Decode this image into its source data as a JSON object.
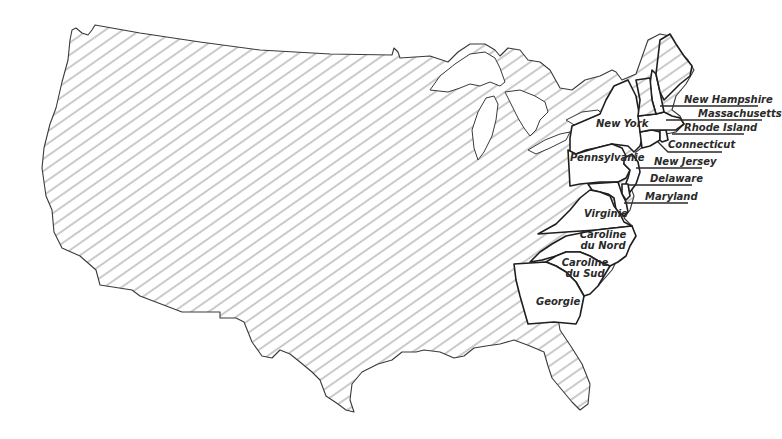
{
  "map": {
    "subject": "Thirteen original colonies on a map of the contiguous United States",
    "fill_pattern": "diagonal-hatch",
    "colors": {
      "outline": "#1e1e1e",
      "hatch": "#8a8a8a",
      "colony_fill": "#ffffff",
      "background": "#ffffff"
    },
    "colonies": [
      {
        "id": "new-hampshire",
        "label": "New Hampshire"
      },
      {
        "id": "massachusetts",
        "label": "Massachusetts"
      },
      {
        "id": "rhode-island",
        "label": "Rhode Island"
      },
      {
        "id": "connecticut",
        "label": "Connecticut"
      },
      {
        "id": "new-york",
        "label": "New York"
      },
      {
        "id": "new-jersey",
        "label": "New Jersey"
      },
      {
        "id": "pennsylvania",
        "label": "Pennsylvanie"
      },
      {
        "id": "delaware",
        "label": "Delaware"
      },
      {
        "id": "maryland",
        "label": "Maryland"
      },
      {
        "id": "virginia",
        "label": "Virginie"
      },
      {
        "id": "north-carolina",
        "label_line1": "Caroline",
        "label_line2": "du Nord"
      },
      {
        "id": "south-carolina",
        "label_line1": "Caroline",
        "label_line2": "du Sud"
      },
      {
        "id": "georgia",
        "label": "Georgie"
      }
    ]
  }
}
